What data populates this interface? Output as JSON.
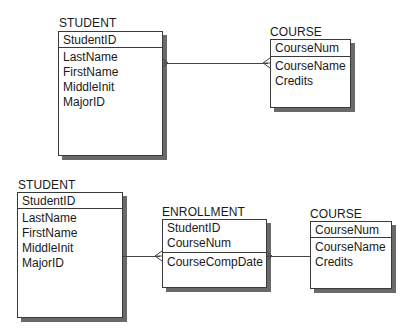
{
  "diagram1": {
    "student": {
      "title": "STUDENT",
      "primary_key": [
        "StudentID"
      ],
      "attributes": [
        "LastName",
        "FirstName",
        "MiddleInit",
        "MajorID"
      ]
    },
    "course": {
      "title": "COURSE",
      "primary_key": [
        "CourseNum"
      ],
      "attributes": [
        "CourseName",
        "Credits"
      ]
    },
    "relationships": [
      {
        "from": "STUDENT",
        "to": "COURSE",
        "type": "many-to-many"
      }
    ]
  },
  "diagram2": {
    "student": {
      "title": "STUDENT",
      "primary_key": [
        "StudentID"
      ],
      "attributes": [
        "LastName",
        "FirstName",
        "MiddleInit",
        "MajorID"
      ]
    },
    "enrollment": {
      "title": "ENROLLMENT",
      "primary_key": [
        "StudentID",
        "CourseNum"
      ],
      "attributes": [
        "CourseCompDate"
      ]
    },
    "course": {
      "title": "COURSE",
      "primary_key": [
        "CourseNum"
      ],
      "attributes": [
        "CourseName",
        "Credits"
      ]
    },
    "relationships": [
      {
        "from": "STUDENT",
        "to": "ENROLLMENT",
        "type": "one-to-many"
      },
      {
        "from": "COURSE",
        "to": "ENROLLMENT",
        "type": "one-to-many"
      }
    ]
  }
}
